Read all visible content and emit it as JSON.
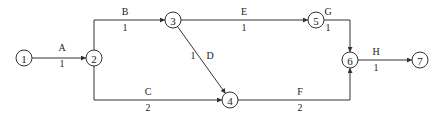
{
  "diagram": {
    "type": "activity-on-arrow network",
    "nodes": [
      {
        "id": "1",
        "label": "1"
      },
      {
        "id": "2",
        "label": "2"
      },
      {
        "id": "3",
        "label": "3"
      },
      {
        "id": "4",
        "label": "4"
      },
      {
        "id": "5",
        "label": "5"
      },
      {
        "id": "6",
        "label": "6"
      },
      {
        "id": "7",
        "label": "7"
      }
    ],
    "activities": [
      {
        "name": "A",
        "from": "1",
        "to": "2",
        "duration": "1"
      },
      {
        "name": "B",
        "from": "2",
        "to": "3",
        "duration": "1"
      },
      {
        "name": "C",
        "from": "2",
        "to": "4",
        "duration": "2"
      },
      {
        "name": "D",
        "from": "3",
        "to": "4",
        "duration": "1"
      },
      {
        "name": "E",
        "from": "3",
        "to": "5",
        "duration": "1"
      },
      {
        "name": "F",
        "from": "4",
        "to": "6",
        "duration": "2"
      },
      {
        "name": "G",
        "from": "5",
        "to": "6",
        "duration": "1"
      },
      {
        "name": "H",
        "from": "6",
        "to": "7",
        "duration": "1"
      }
    ],
    "colors": {
      "stroke": "#333333",
      "text": "#222222",
      "background": "#ffffff"
    }
  }
}
